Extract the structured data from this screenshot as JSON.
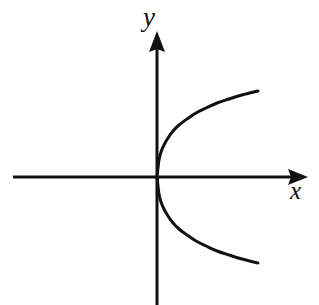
{
  "figure": {
    "kind": "coordinate-plane-plot",
    "background_color": "#ffffff",
    "stroke_color": "#111111",
    "width": 319,
    "height": 305
  },
  "axes": {
    "x_label": "x",
    "y_label": "y",
    "x_axis": {
      "name": "horizontal-axis",
      "y_pixel": 177,
      "x_start": 13,
      "x_end": 308,
      "stroke_width": 3,
      "arrow_at": "right"
    },
    "y_axis": {
      "name": "vertical-axis",
      "x_pixel": 157,
      "y_start": 33,
      "y_end": 305,
      "stroke_width": 3,
      "arrow_at": "top"
    },
    "origin": {
      "x": 157,
      "y": 177
    },
    "ticks": [],
    "tick_labels": [],
    "gridlines": false
  },
  "chart_data": {
    "type": "line",
    "title": "",
    "subtitle": "",
    "xlabel": "x",
    "ylabel": "y",
    "grid": false,
    "legend": null,
    "annotations": [],
    "curve_equation": "x = y^2 / 130",
    "orientation": "opens-right",
    "vertex": {
      "x": 0,
      "y": 0
    },
    "series": [
      {
        "name": "parabola-upper-branch",
        "color": "#111111",
        "stroke_width": 3,
        "points_px": [
          [
            157,
            177
          ],
          [
            158,
            168
          ],
          [
            159,
            160
          ],
          [
            161,
            152
          ],
          [
            164,
            145
          ],
          [
            168,
            138
          ],
          [
            173,
            131
          ],
          [
            179,
            125
          ],
          [
            187,
            119
          ],
          [
            196,
            113
          ],
          [
            206,
            108
          ],
          [
            217,
            103
          ],
          [
            229,
            99
          ],
          [
            242,
            95
          ],
          [
            258,
            91
          ]
        ]
      },
      {
        "name": "parabola-lower-branch",
        "color": "#111111",
        "stroke_width": 3,
        "points_px": [
          [
            157,
            177
          ],
          [
            158,
            186
          ],
          [
            159,
            194
          ],
          [
            161,
            202
          ],
          [
            164,
            209
          ],
          [
            168,
            216
          ],
          [
            173,
            223
          ],
          [
            179,
            229
          ],
          [
            187,
            235
          ],
          [
            196,
            241
          ],
          [
            206,
            246
          ],
          [
            217,
            251
          ],
          [
            229,
            255
          ],
          [
            242,
            259
          ],
          [
            258,
            263
          ]
        ]
      }
    ],
    "endpoints_px": {
      "upper": [
        258,
        91
      ],
      "lower": [
        258,
        263
      ]
    }
  }
}
